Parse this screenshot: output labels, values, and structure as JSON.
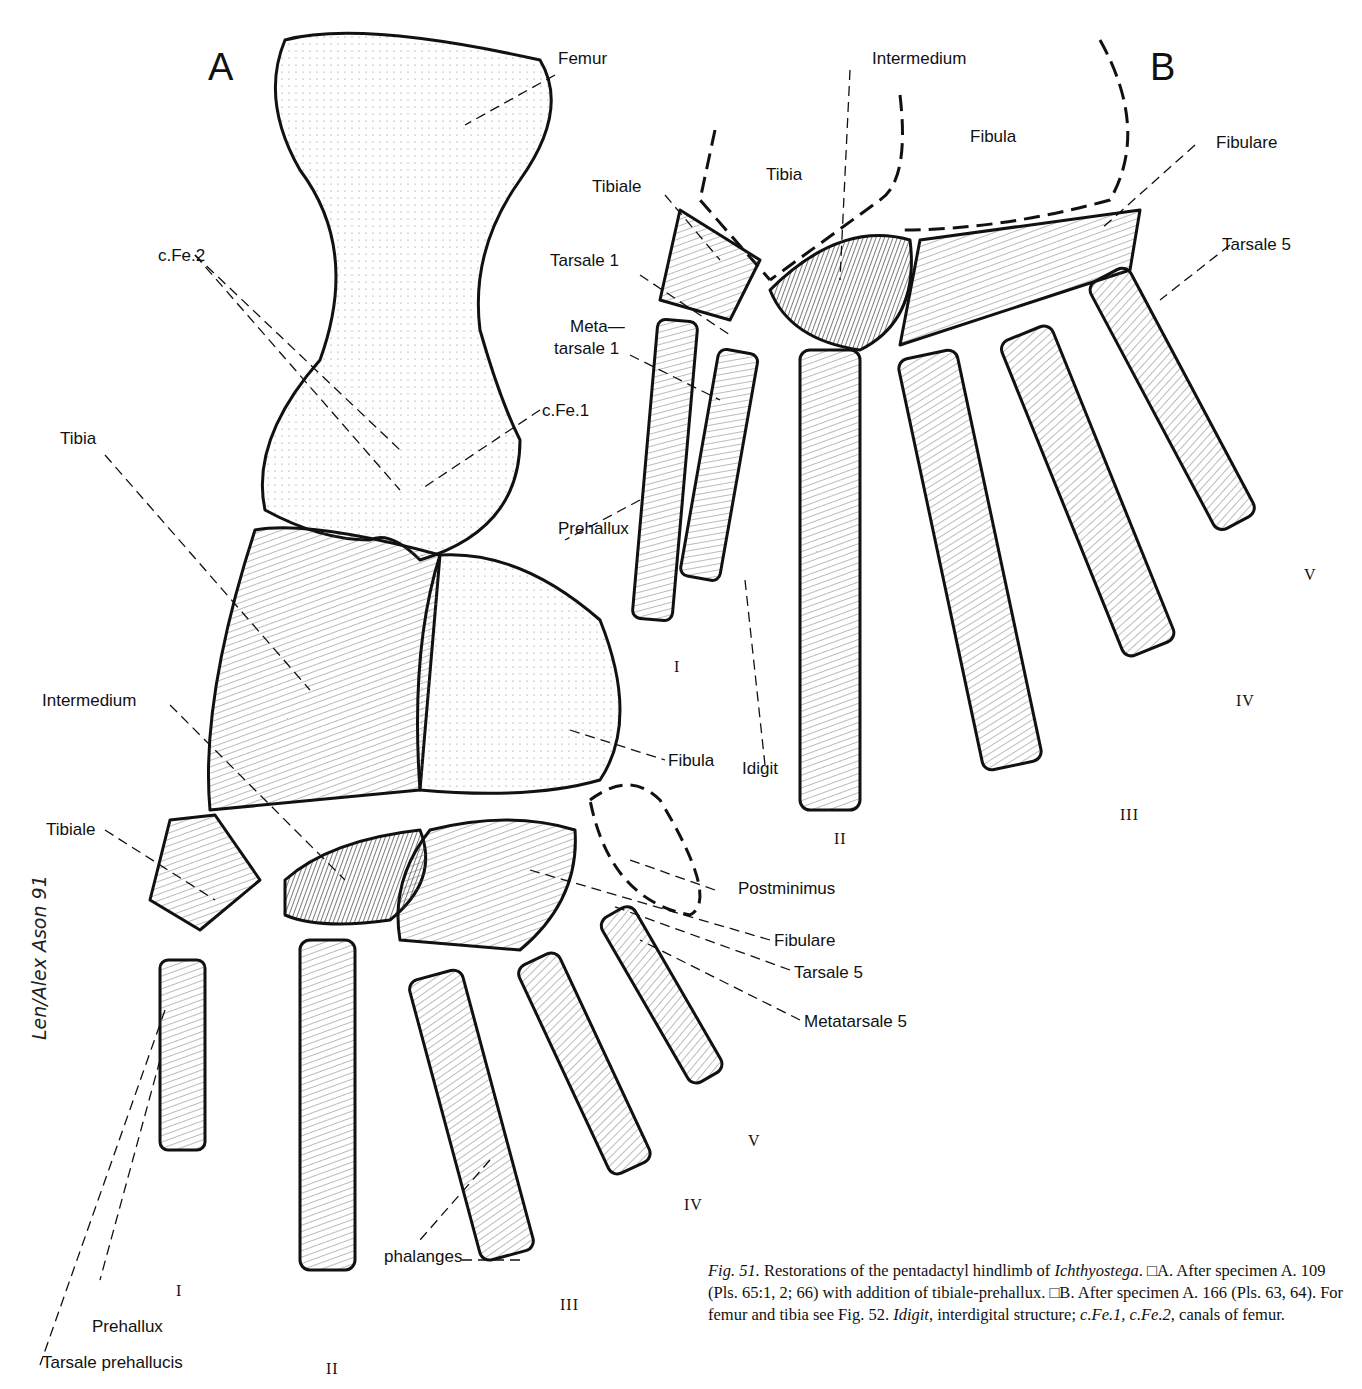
{
  "figure": {
    "panels": {
      "a": "A",
      "b": "B"
    },
    "panel_a": {
      "labels": {
        "femur": "Femur",
        "cfe2": "c.Fe.2",
        "cfe1": "c.Fe.1",
        "tibia": "Tibia",
        "intermedium": "Intermedium",
        "fibula": "Fibula",
        "tibiale": "Tibiale",
        "postminimus": "Postminimus",
        "fibulare": "Fibulare",
        "tarsale5": "Tarsale 5",
        "metatarsale5": "Metatarsale 5",
        "phalanges": "phalanges",
        "prehallux": "Prehallux",
        "tarsale_prehallucis": "Tarsale prehallucis"
      },
      "digits": [
        "I",
        "II",
        "III",
        "IV",
        "V"
      ]
    },
    "panel_b": {
      "labels": {
        "intermedium": "Intermedium",
        "fibula": "Fibula",
        "tibia": "Tibia",
        "tibiale": "Tibiale",
        "fibulare": "Fibulare",
        "tarsale1": "Tarsale 1",
        "tarsale5": "Tarsale 5",
        "metatarsale1_line1": "Meta—",
        "metatarsale1_line2": "tarsale 1",
        "prehallux": "Prehallux",
        "idigit": "Idigit"
      },
      "digits": [
        "I",
        "II",
        "III",
        "IV",
        "V"
      ]
    },
    "signature": "Len/Alex Ason 91"
  },
  "caption": {
    "fig_label": "Fig. 51.",
    "text1": " Restorations of the pentadactyl hindlimb of ",
    "taxon": "Ichthyostega",
    "text2": ". □A. After specimen A. 109 (Pls. 65:1, 2; 66) with addition of tibiale-prehallux. □B. After specimen A. 166 (Pls. 63, 64). For femur and tibia see Fig. 52. ",
    "idigit": "Idigit",
    "text3": ", interdigital structure; ",
    "cfe": "c.Fe.1, c.Fe.2",
    "text4": ", canals of femur."
  }
}
